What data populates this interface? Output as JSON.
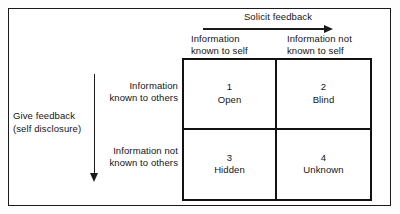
{
  "diagram": {
    "frame_color": "#1a1a1a",
    "grid_color": "#121212",
    "background": "#ffffff",
    "top_axis": {
      "label": "Solicit feedback",
      "arrow_direction": "right",
      "arrow_icon": "arrow-right-icon"
    },
    "left_axis": {
      "label_line1": "Give feedback",
      "label_line2": "(self disclosure)",
      "arrow_direction": "down",
      "arrow_icon": "arrow-down-icon"
    },
    "columns": [
      {
        "line1": "Information",
        "line2": "known to self"
      },
      {
        "line1": "Information not",
        "line2": "known to self"
      }
    ],
    "rows": [
      {
        "line1": "Information",
        "line2": "known to others"
      },
      {
        "line1": "Information not",
        "line2": "known to others"
      }
    ],
    "quadrants": [
      {
        "number": "1",
        "name": "Open"
      },
      {
        "number": "2",
        "name": "Blind"
      },
      {
        "number": "3",
        "name": "Hidden"
      },
      {
        "number": "4",
        "name": "Unknown"
      }
    ]
  }
}
